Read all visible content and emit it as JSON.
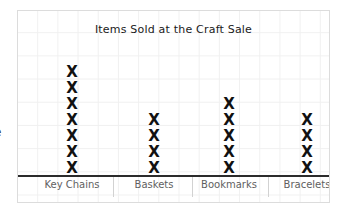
{
  "chart_data": {
    "type": "bar",
    "plot_style": "pictograph-x-stack",
    "title": "Items Sold at the Craft Sale",
    "xlabel": "",
    "ylabel": "",
    "categories": [
      "Key Chains",
      "Baskets",
      "Bookmarks",
      "Bracelets"
    ],
    "values": [
      7,
      4,
      5,
      4
    ],
    "ylim": [
      0,
      8
    ],
    "grid": true,
    "legend": false,
    "mark_glyph": "X",
    "series": [
      {
        "name": "Items Sold",
        "values": [
          7,
          4,
          5,
          4
        ]
      }
    ]
  },
  "figure": {
    "title": "Items Sold at the Craft Sale",
    "axis_label_text": "e",
    "border_color": "#dcdcdc",
    "grid_color": "#f0f0f0",
    "axis_color": "#2b2b2b",
    "mark_color": "#111111",
    "label_color": "#5f5f5f",
    "background_color": "#ffffff"
  },
  "columns": [
    {
      "label": "Key Chains",
      "count": 7,
      "center_x": 54,
      "marks": [
        "X",
        "X",
        "X",
        "X",
        "X",
        "X",
        "X"
      ]
    },
    {
      "label": "Baskets",
      "count": 4,
      "center_x": 136,
      "marks": [
        "X",
        "X",
        "X",
        "X"
      ]
    },
    {
      "label": "Bookmarks",
      "count": 5,
      "center_x": 211,
      "marks": [
        "X",
        "X",
        "X",
        "X",
        "X"
      ]
    },
    {
      "label": "Bracelets",
      "count": 4,
      "center_x": 289,
      "marks": [
        "X",
        "X",
        "X",
        "X"
      ]
    }
  ]
}
